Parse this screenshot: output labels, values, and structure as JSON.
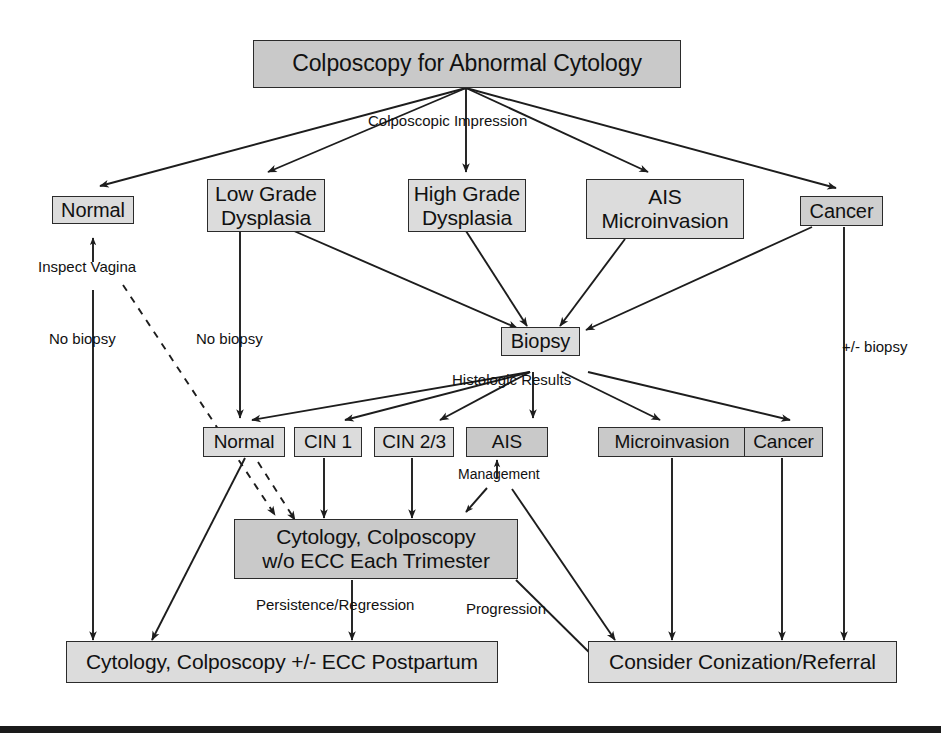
{
  "diagram": {
    "title": "Colposcopy for Abnormal Cytology",
    "nodes": {
      "root": "Colposcopy for Abnormal Cytology",
      "impression_normal": "Normal",
      "low_grade": "Low Grade\nDysplasia",
      "high_grade": "High Grade\nDysplasia",
      "ais_micro": "AIS\nMicroinvasion",
      "impression_cancer": "Cancer",
      "biopsy": "Biopsy",
      "histo_normal": "Normal",
      "cin1": "CIN 1",
      "cin23": "CIN 2/3",
      "ais": "AIS",
      "microinvasion": "Microinvasion",
      "histo_cancer": "Cancer",
      "surveillance": "Cytology, Colposcopy\nw/o ECC Each Trimester",
      "postpartum": "Cytology, Colposcopy +/- ECC Postpartum",
      "conization": "Consider Conization/Referral"
    },
    "edge_labels": {
      "colposcopic_impression": "Colposcopic Impression",
      "inspect_vagina": "Inspect Vagina",
      "no_biopsy_left": "No biopsy",
      "no_biopsy_mid": "No biopsy",
      "plus_minus_biopsy": "+/- biopsy",
      "histologic_results": "Histologic Results",
      "management": "Management",
      "persistence_regression": "Persistence/Regression",
      "progression": "Progression"
    },
    "colors": {
      "node_fill": "#c9c9c9",
      "node_fill_light": "#dcdcdc",
      "stroke": "#2b2b2b",
      "text": "#111111",
      "rule": "#1a1a1a",
      "background": "#ffffff"
    }
  }
}
